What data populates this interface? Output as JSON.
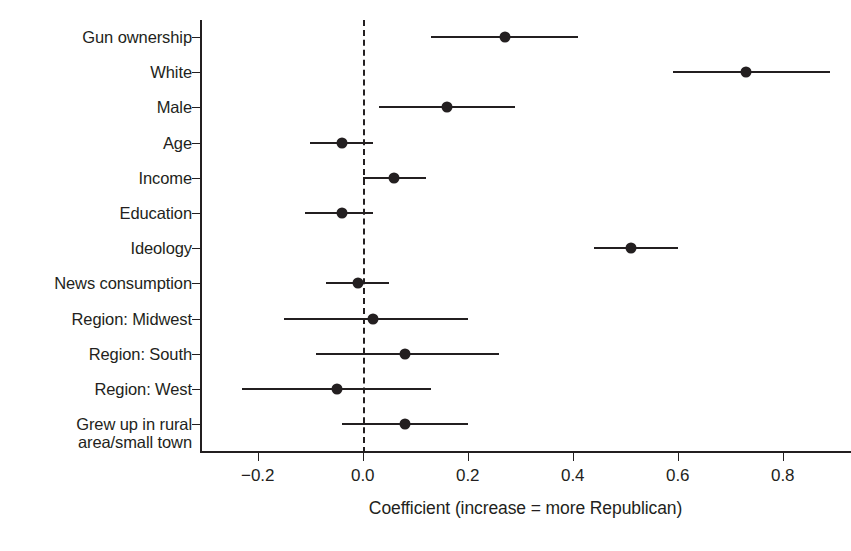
{
  "chart_data": {
    "type": "scatter",
    "plot_style": "coefficient-plot-with-error-bars",
    "title": "",
    "xlabel": "Coefficient (increase = more Republican)",
    "ylabel": "",
    "xlim": [
      -0.31,
      0.93
    ],
    "xticks": [
      -0.2,
      0.0,
      0.2,
      0.4,
      0.6,
      0.8
    ],
    "xtick_labels": [
      "−0.2",
      "0.0",
      "0.2",
      "0.4",
      "0.6",
      "0.8"
    ],
    "grid": false,
    "legend": null,
    "reference_line": {
      "value": 0.0,
      "style": "dashed"
    },
    "categories": [
      "Gun ownership",
      "White",
      "Male",
      "Age",
      "Income",
      "Education",
      "Ideology",
      "News consumption",
      "Region: Midwest",
      "Region: South",
      "Region: West",
      "Grew up in rural\narea/small town"
    ],
    "values": [
      0.27,
      0.73,
      0.16,
      -0.04,
      0.06,
      -0.04,
      0.51,
      -0.01,
      0.02,
      0.08,
      -0.05,
      0.08
    ],
    "ci_low": [
      0.13,
      0.59,
      0.03,
      -0.1,
      0.0,
      -0.11,
      0.44,
      -0.07,
      -0.15,
      -0.09,
      -0.23,
      -0.04
    ],
    "ci_high": [
      0.41,
      0.89,
      0.29,
      0.02,
      0.12,
      0.02,
      0.6,
      0.05,
      0.2,
      0.26,
      0.13,
      0.2
    ],
    "point_color": "#231f20",
    "line_color": "#231f20"
  },
  "axis": {
    "x_title": "Coefficient (increase = more Republican)"
  }
}
